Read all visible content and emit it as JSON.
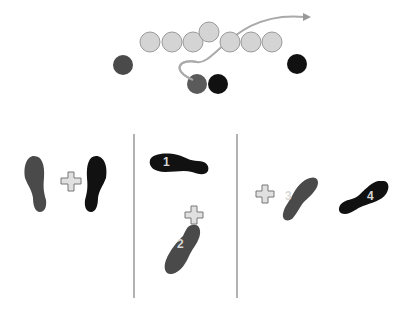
{
  "diagram": {
    "formation": {
      "linemen": [
        {
          "x": 150,
          "y": 42
        },
        {
          "x": 172,
          "y": 42
        },
        {
          "x": 193,
          "y": 42
        },
        {
          "x": 209,
          "y": 32
        },
        {
          "x": 230,
          "y": 42
        },
        {
          "x": 251,
          "y": 42
        },
        {
          "x": 272,
          "y": 42
        }
      ],
      "lineman_color": "#d4d4d4",
      "players": [
        {
          "x": 123,
          "y": 65,
          "color": "#4a4a4a"
        },
        {
          "x": 297,
          "y": 64,
          "color": "#111111"
        },
        {
          "x": 197,
          "y": 84,
          "color": "#5a5a5a"
        },
        {
          "x": 218,
          "y": 84,
          "color": "#111111"
        }
      ],
      "route_color": "#aaaaaa"
    },
    "panels": [
      {
        "id": "stance",
        "steps": []
      },
      {
        "id": "steps-1-2",
        "steps": [
          "1",
          "2"
        ]
      },
      {
        "id": "steps-3-4",
        "steps": [
          "3",
          "4"
        ]
      }
    ],
    "colors": {
      "foot_dark_gray": "#4a4a4a",
      "foot_black": "#111111",
      "plus_fill": "#e0e0e0",
      "plus_stroke": "#777777",
      "divider": "#999999"
    }
  }
}
